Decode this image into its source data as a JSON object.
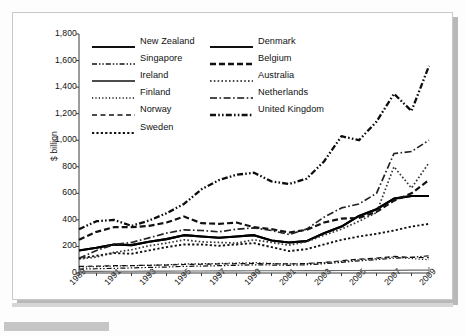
{
  "page": {
    "background_color": "#fdfdfd",
    "card_color": "#ffffff"
  },
  "chart_data": {
    "type": "line",
    "title": "",
    "xlabel": "",
    "ylabel": "$ billion",
    "ylim": [
      0,
      1800
    ],
    "ytick_step": 200,
    "ytick_labels": [
      "1,800",
      "1,600",
      "1,400",
      "1,200",
      "1,000",
      "800",
      "600",
      "400",
      "200",
      "0"
    ],
    "grid": false,
    "legend_position": "top-left-inside",
    "x": [
      1989,
      1990,
      1991,
      1992,
      1993,
      1994,
      1995,
      1996,
      1997,
      1998,
      1999,
      2000,
      2001,
      2002,
      2003,
      2004,
      2005,
      2006,
      2007,
      2008,
      2009
    ],
    "xtick_labels": [
      "1989",
      "1991",
      "1993",
      "1995",
      "1997",
      "1999",
      "2001",
      "2003",
      "2005",
      "2007",
      "2009"
    ],
    "series": [
      {
        "name": "New Zealand",
        "style": "solid",
        "width": 2.1,
        "color": "#000000",
        "values": [
          170,
          190,
          215,
          210,
          235,
          255,
          285,
          275,
          265,
          275,
          285,
          245,
          230,
          240,
          300,
          350,
          430,
          480,
          560,
          580,
          580
        ]
      },
      {
        "name": "Singapore",
        "style": "dashdotdot",
        "width": 1.2,
        "color": "#111111",
        "values": [
          30,
          32,
          35,
          38,
          42,
          45,
          50,
          52,
          55,
          58,
          62,
          60,
          58,
          62,
          70,
          80,
          92,
          100,
          112,
          118,
          130
        ]
      },
      {
        "name": "Ireland",
        "style": "solid",
        "width": 1.2,
        "color": "#6b6b6b",
        "values": [
          12,
          12,
          13,
          13,
          14,
          14,
          15,
          15,
          16,
          16,
          17,
          17,
          17,
          18,
          18,
          19,
          19,
          20,
          20,
          21,
          22
        ]
      },
      {
        "name": "Finland",
        "style": "dotted-fine",
        "width": 1.2,
        "color": "#111111",
        "values": [
          45,
          48,
          52,
          55,
          58,
          62,
          68,
          70,
          72,
          75,
          78,
          72,
          68,
          70,
          78,
          88,
          100,
          108,
          120,
          108,
          100
        ]
      },
      {
        "name": "Norway",
        "style": "dashed-long",
        "width": 1.2,
        "color": "#111111",
        "values": [
          50,
          52,
          55,
          56,
          58,
          60,
          64,
          66,
          68,
          70,
          72,
          70,
          68,
          72,
          80,
          92,
          105,
          112,
          125,
          118,
          115
        ]
      },
      {
        "name": "Sweden",
        "style": "dotted-thick",
        "width": 1.9,
        "color": "#111111",
        "values": [
          110,
          130,
          150,
          145,
          170,
          195,
          215,
          215,
          205,
          215,
          225,
          195,
          165,
          180,
          215,
          250,
          275,
          295,
          320,
          350,
          370
        ]
      },
      {
        "name": "Denmark",
        "style": "solid",
        "width": 2.1,
        "color": "#000000",
        "values": [
          170,
          190,
          215,
          210,
          235,
          255,
          285,
          275,
          265,
          275,
          285,
          245,
          230,
          240,
          300,
          350,
          430,
          480,
          560,
          580,
          580
        ]
      },
      {
        "name": "Belgium",
        "style": "dashed",
        "width": 2.2,
        "color": "#111111",
        "values": [
          250,
          310,
          345,
          345,
          355,
          380,
          425,
          375,
          370,
          380,
          345,
          330,
          305,
          325,
          380,
          410,
          415,
          460,
          545,
          600,
          700
        ]
      },
      {
        "name": "Australia",
        "style": "dotted",
        "width": 1.7,
        "color": "#333333",
        "values": [
          105,
          120,
          155,
          175,
          205,
          225,
          250,
          235,
          230,
          225,
          250,
          230,
          210,
          235,
          285,
          330,
          390,
          455,
          800,
          640,
          830
        ]
      },
      {
        "name": "Netherlands",
        "style": "dashdot",
        "width": 1.7,
        "color": "#222222",
        "values": [
          110,
          170,
          215,
          230,
          265,
          300,
          325,
          320,
          310,
          330,
          340,
          320,
          290,
          330,
          420,
          490,
          520,
          600,
          900,
          915,
          1000
        ]
      },
      {
        "name": "United Kingdom",
        "style": "dashdotdot-thick",
        "width": 2.3,
        "color": "#0d0d0d",
        "values": [
          330,
          390,
          400,
          355,
          395,
          450,
          520,
          630,
          700,
          740,
          755,
          690,
          670,
          710,
          840,
          1030,
          1000,
          1140,
          1350,
          1220,
          1560
        ]
      }
    ]
  },
  "legend": {
    "left_column": [
      {
        "label": "New Zealand",
        "swatch": "solid-thick"
      },
      {
        "label": "Singapore",
        "swatch": "dashdotdot"
      },
      {
        "label": "Ireland",
        "swatch": "solid-thin"
      },
      {
        "label": "Finland",
        "swatch": "dotted-fine"
      },
      {
        "label": "Norway",
        "swatch": "dashed-long"
      },
      {
        "label": "Sweden",
        "swatch": "dotted-thick"
      }
    ],
    "right_column": [
      {
        "label": "Denmark",
        "swatch": "solid-thick"
      },
      {
        "label": "Belgium",
        "swatch": "dashed"
      },
      {
        "label": "Australia",
        "swatch": "dotted"
      },
      {
        "label": "Netherlands",
        "swatch": "dashdot"
      },
      {
        "label": "United Kingdom",
        "swatch": "dashdotdot-thick"
      }
    ]
  }
}
